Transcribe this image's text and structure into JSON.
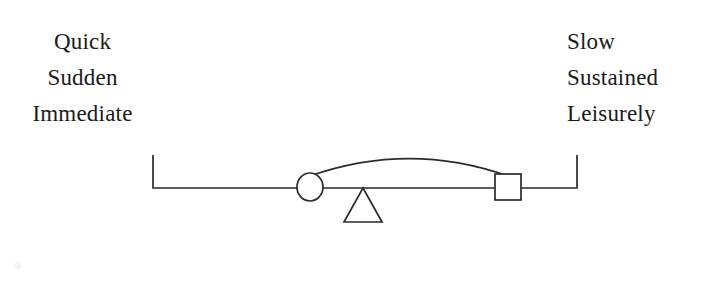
{
  "figure": {
    "background_color": "#ffffff",
    "ink_color": "#2b2b2b",
    "text_color": "#1a1a1a",
    "left_pole": {
      "lines": [
        "Quick",
        "Sudden",
        "Immediate"
      ]
    },
    "right_pole": {
      "lines": [
        "Slow",
        "Sustained",
        "Leisurely"
      ]
    },
    "scale": {
      "beam_label": "balance-beam",
      "left_end_tick_label": "left-end-tick",
      "right_end_tick_label": "right-end-tick",
      "fulcrum_label": "fulcrum-triangle",
      "circle_marker_label": "circle-marker",
      "square_marker_label": "square-marker",
      "arc_label": "connecting-arc"
    }
  },
  "chart_data": {
    "type": "diagram",
    "title": "",
    "xlabel": "",
    "ylabel": "",
    "categories": [
      "Quick / Sudden / Immediate",
      "Slow / Sustained / Leisurely"
    ],
    "axis_range_px": [
      153,
      577
    ],
    "baseline_y_px": 188,
    "markers": [
      {
        "name": "circle-marker",
        "shape": "circle",
        "x_px": 310,
        "y_px": 187,
        "radius_px": 13,
        "pole": "left"
      },
      {
        "name": "square-marker",
        "shape": "square",
        "x_px": 508,
        "y_px": 187,
        "size_px": 26,
        "pole": "right"
      },
      {
        "name": "fulcrum-triangle",
        "shape": "triangle",
        "apex_x_px": 363,
        "apex_y_px": 188,
        "base_half_width_px": 19,
        "base_y_px": 222
      }
    ],
    "arc": {
      "from_x_px": 310,
      "from_y_px": 176,
      "to_x_px": 508,
      "to_y_px": 176,
      "peak_y_px": 154
    },
    "grid": false,
    "legend": "none"
  }
}
